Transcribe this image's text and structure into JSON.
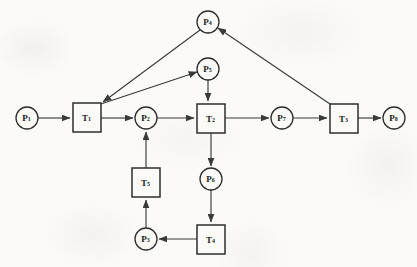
{
  "diagram": {
    "type": "petri-net",
    "title": "",
    "background_color": "#fbfaf7",
    "stroke_color": "#2e2e2e",
    "edge_color": "#3a3a3a"
  },
  "places": [
    {
      "id": "P1",
      "label": "P",
      "sub": "1",
      "cx": 27,
      "cy": 118,
      "r": 11
    },
    {
      "id": "P2",
      "label": "P",
      "sub": "2",
      "cx": 146,
      "cy": 118,
      "r": 11
    },
    {
      "id": "P3",
      "label": "P",
      "sub": "3",
      "cx": 146,
      "cy": 239,
      "r": 11
    },
    {
      "id": "P4",
      "label": "P",
      "sub": "4",
      "cx": 208,
      "cy": 22,
      "r": 11
    },
    {
      "id": "P5",
      "label": "P",
      "sub": "5",
      "cx": 208,
      "cy": 69,
      "r": 11
    },
    {
      "id": "P6",
      "label": "P",
      "sub": "6",
      "cx": 211,
      "cy": 179,
      "r": 11
    },
    {
      "id": "P7",
      "label": "P",
      "sub": "7",
      "cx": 282,
      "cy": 118,
      "r": 11
    },
    {
      "id": "P8",
      "label": "P",
      "sub": "8",
      "cx": 394,
      "cy": 118,
      "r": 11
    }
  ],
  "transitions": [
    {
      "id": "T1",
      "label": "T",
      "sub": "1",
      "x": 73,
      "y": 103,
      "w": 28,
      "h": 29
    },
    {
      "id": "T2",
      "label": "T",
      "sub": "2",
      "x": 197,
      "y": 104,
      "w": 28,
      "h": 29
    },
    {
      "id": "T3",
      "label": "T",
      "sub": "3",
      "x": 330,
      "y": 104,
      "w": 28,
      "h": 29
    },
    {
      "id": "T4",
      "label": "T",
      "sub": "4",
      "x": 197,
      "y": 225,
      "w": 28,
      "h": 29
    },
    {
      "id": "T5",
      "label": "T",
      "sub": "5",
      "x": 132,
      "y": 168,
      "w": 28,
      "h": 29
    }
  ],
  "arcs": [
    {
      "from": "P1",
      "to": "T1",
      "path": "M38,118 L70,118"
    },
    {
      "from": "T1",
      "to": "P2",
      "path": "M101,118 L133,118"
    },
    {
      "from": "P2",
      "to": "T2",
      "path": "M157,118 L194,118"
    },
    {
      "from": "T2",
      "to": "P7",
      "path": "M225,118 L269,118"
    },
    {
      "from": "P7",
      "to": "T3",
      "path": "M293,118 L327,118"
    },
    {
      "from": "T3",
      "to": "P8",
      "path": "M358,118 L381,118"
    },
    {
      "from": "T1",
      "to": "P5",
      "path": "M101,104 L197,72"
    },
    {
      "from": "P5",
      "to": "T2",
      "path": "M208,80 L208,101"
    },
    {
      "from": "P4",
      "to": "T1",
      "path": "M200,30 L103,102"
    },
    {
      "from": "T3",
      "to": "P4",
      "path": "M330,104 L218,28"
    },
    {
      "from": "T2",
      "to": "P6",
      "path": "M211,133 L211,166"
    },
    {
      "from": "P6",
      "to": "T4",
      "path": "M211,190 L211,222"
    },
    {
      "from": "T4",
      "to": "P3",
      "path": "M197,239 L159,239"
    },
    {
      "from": "P3",
      "to": "T5",
      "path": "M146,228 L146,200"
    },
    {
      "from": "T5",
      "to": "P2",
      "path": "M146,168 L146,132"
    }
  ]
}
